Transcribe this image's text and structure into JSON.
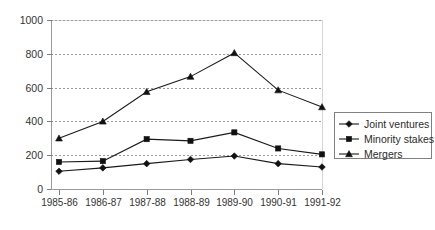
{
  "chart_data": {
    "type": "line",
    "title": "",
    "xlabel": "",
    "ylabel": "",
    "categories": [
      "1985-86",
      "1986-87",
      "1987-88",
      "1988-89",
      "1989-90",
      "1990-91",
      "1991-92"
    ],
    "yticks": [
      0,
      200,
      400,
      600,
      800,
      1000
    ],
    "ylim": [
      0,
      1000
    ],
    "grid": "horizontal-dashed",
    "legend_position": "right",
    "series": [
      {
        "name": "Joint ventures",
        "marker": "diamond",
        "values": [
          105,
          125,
          150,
          175,
          195,
          150,
          130
        ]
      },
      {
        "name": "Minority stakes",
        "marker": "square",
        "values": [
          160,
          165,
          295,
          285,
          335,
          240,
          205
        ]
      },
      {
        "name": "Mergers",
        "marker": "triangle",
        "values": [
          300,
          400,
          575,
          665,
          805,
          585,
          485
        ]
      }
    ]
  },
  "legend": {
    "items": [
      {
        "label": "Joint ventures"
      },
      {
        "label": "Minority stakes"
      },
      {
        "label": "Mergers"
      }
    ]
  }
}
